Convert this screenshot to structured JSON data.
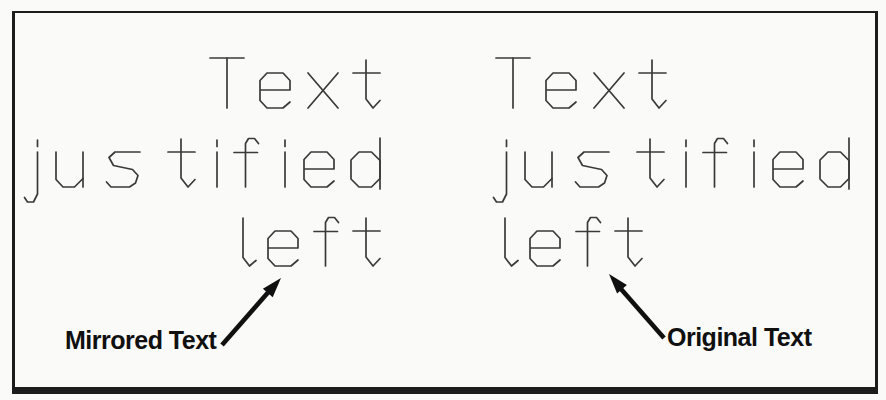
{
  "canvas": {
    "background": "#fafaf8",
    "frame_color": "#1c1c1c",
    "cad_stroke_color": "#3a3a3a",
    "ink_color": "#101010"
  },
  "mirrored_block": {
    "lines": [
      "Text",
      "justified",
      "left"
    ],
    "alignment": "right",
    "callout": "Mirrored Text"
  },
  "original_block": {
    "lines": [
      "Text",
      "justified",
      "left"
    ],
    "alignment": "left",
    "callout": "Original Text"
  }
}
